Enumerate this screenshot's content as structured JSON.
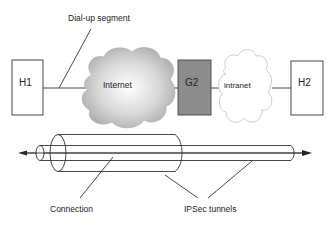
{
  "top": {
    "dialup_label": "Dial-up segment",
    "nodes": {
      "h1": "H1",
      "internet": "Internet",
      "g2": "G2",
      "intranet": "intranet",
      "h2": "H2"
    }
  },
  "bottom": {
    "connection_label": "Connection",
    "ipsec_label": "IPSec tunnels"
  },
  "colors": {
    "g2_fill": "#8c8c8c",
    "stroke": "#333333",
    "internet_cloud_center": "#ffffff",
    "internet_cloud_edge": "#a9a9a9"
  }
}
